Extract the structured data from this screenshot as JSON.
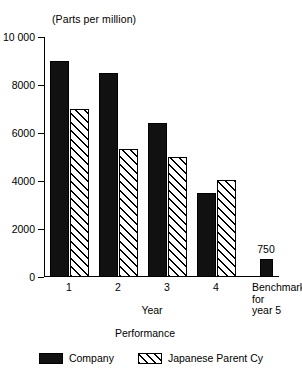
{
  "chart_data": {
    "type": "bar",
    "title": "",
    "unit_caption": "(Parts per million)",
    "xlabel": "Year",
    "xlabel_secondary": "Performance",
    "ylabel": "",
    "ylim": [
      0,
      10000
    ],
    "grid": false,
    "legend_position": "bottom",
    "ytick_labels": [
      "10 000",
      "8000",
      "6000",
      "4000",
      "2000",
      "0"
    ],
    "ytick_values": [
      10000,
      8000,
      6000,
      4000,
      2000,
      0
    ],
    "categories": [
      "1",
      "2",
      "3",
      "4",
      "Benchmark for year 5"
    ],
    "category_labels": [
      {
        "text": "1",
        "multiline": false
      },
      {
        "text": "2",
        "multiline": false
      },
      {
        "text": "3",
        "multiline": false
      },
      {
        "text": "4",
        "multiline": false
      },
      {
        "text": "Benchmark for year 5",
        "multiline": true,
        "lines": [
          "Benchmark",
          "for",
          "year 5"
        ]
      }
    ],
    "series": [
      {
        "name": "Company",
        "style": "solid-black",
        "color": "#111111",
        "values": [
          9000,
          8500,
          6400,
          3500,
          750
        ]
      },
      {
        "name": "Japanese Parent Cy",
        "style": "diagonal-hatch",
        "color": "#ffffff",
        "values": [
          7000,
          5350,
          5000,
          4050,
          null
        ]
      }
    ],
    "data_labels": [
      {
        "category": "Benchmark for year 5",
        "series": "Company",
        "value": 750,
        "text": "750"
      }
    ],
    "legend": [
      {
        "label": "Company",
        "style": "solid-black"
      },
      {
        "label": "Japanese Parent Cy",
        "style": "diagonal-hatch"
      }
    ]
  }
}
